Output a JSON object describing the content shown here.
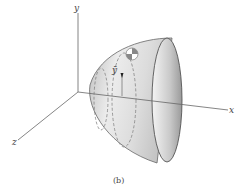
{
  "figure": {
    "caption": "(b)",
    "axes": {
      "x_label": "x",
      "y_label": "y",
      "z_label": "z"
    },
    "centroid_label": "ȳ",
    "shape": "paraboloid of revolution (solid)",
    "colors": {
      "axis": "#555555",
      "surface_light": "#f2f2f2",
      "surface_mid": "#d4d4d4",
      "surface_dark": "#a8a8a8",
      "outline": "#555555",
      "dashed": "#777777"
    }
  }
}
